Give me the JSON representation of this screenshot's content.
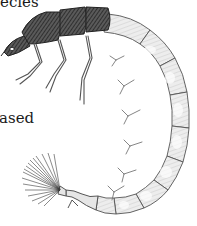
{
  "figure": {
    "text_fragments": [
      {
        "id": "top",
        "text": "ecies"
      },
      {
        "id": "left",
        "text": "ased"
      }
    ],
    "colors": {
      "ink_dark": "#2a2a2a",
      "ink_mid": "#6a6a6a",
      "ink_light": "#b0b0b0",
      "paper": "#ffffff"
    }
  }
}
